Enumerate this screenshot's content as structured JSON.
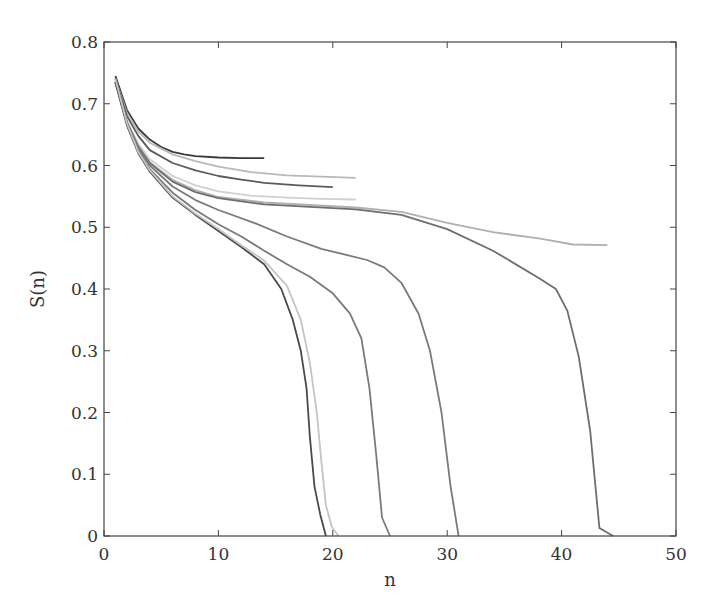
{
  "chart_data": {
    "type": "line",
    "title": "",
    "xlabel": "n",
    "ylabel": "S(n)",
    "xlim": [
      0,
      50
    ],
    "ylim": [
      0,
      0.8
    ],
    "xticks": [
      0,
      10,
      20,
      30,
      40,
      50
    ],
    "xtick_labels": [
      "0",
      "10",
      "20",
      "30",
      "40",
      "50"
    ],
    "yticks": [
      0,
      0.1,
      0.2,
      0.3,
      0.4,
      0.5,
      0.6,
      0.7,
      0.8
    ],
    "ytick_labels": [
      "0",
      "0.1",
      "0.2",
      "0.3",
      "0.4",
      "0.5",
      "0.6",
      "0.7",
      "0.8"
    ],
    "grid": false,
    "legend": null,
    "series": [
      {
        "name": "curve-1",
        "color": "#3a3a3a",
        "x": [
          1,
          2,
          3,
          4,
          5,
          6,
          7,
          8,
          10,
          12,
          14
        ],
        "y": [
          0.745,
          0.69,
          0.66,
          0.642,
          0.63,
          0.622,
          0.618,
          0.615,
          0.613,
          0.612,
          0.612
        ]
      },
      {
        "name": "curve-2",
        "color": "#b8b8b8",
        "x": [
          1,
          2,
          3,
          4,
          6,
          8,
          10,
          13,
          16,
          19,
          22
        ],
        "y": [
          0.74,
          0.685,
          0.655,
          0.637,
          0.618,
          0.607,
          0.598,
          0.589,
          0.584,
          0.582,
          0.58
        ]
      },
      {
        "name": "curve-3",
        "color": "#5a5a5a",
        "x": [
          1,
          2,
          3,
          4,
          6,
          8,
          10,
          12,
          14,
          17,
          20
        ],
        "y": [
          0.74,
          0.68,
          0.648,
          0.625,
          0.604,
          0.592,
          0.583,
          0.577,
          0.572,
          0.568,
          0.565
        ]
      },
      {
        "name": "curve-4",
        "color": "#d0d0d0",
        "x": [
          1,
          2,
          3,
          4,
          6,
          8,
          10,
          13,
          16,
          19,
          22
        ],
        "y": [
          0.735,
          0.672,
          0.635,
          0.61,
          0.583,
          0.568,
          0.558,
          0.551,
          0.548,
          0.546,
          0.545
        ]
      },
      {
        "name": "curve-5",
        "color": "#b0b0b0",
        "x": [
          1,
          2,
          3,
          4,
          6,
          8,
          10,
          14,
          18,
          22,
          26,
          30,
          34,
          38,
          41,
          44
        ],
        "y": [
          0.735,
          0.67,
          0.632,
          0.605,
          0.577,
          0.56,
          0.549,
          0.54,
          0.536,
          0.532,
          0.525,
          0.507,
          0.492,
          0.482,
          0.472,
          0.471
        ]
      },
      {
        "name": "curve-6",
        "color": "#6e6e6e",
        "x": [
          1,
          2,
          3,
          4,
          6,
          8,
          10,
          14,
          18,
          22,
          26,
          30,
          34,
          38,
          39.5,
          40.5,
          41.5,
          42.5,
          43.3,
          44.5
        ],
        "y": [
          0.735,
          0.67,
          0.63,
          0.604,
          0.574,
          0.557,
          0.547,
          0.537,
          0.533,
          0.529,
          0.52,
          0.497,
          0.462,
          0.418,
          0.4,
          0.365,
          0.29,
          0.17,
          0.013,
          0.0
        ]
      },
      {
        "name": "curve-7",
        "color": "#7a7a7a",
        "x": [
          1,
          2,
          3,
          4,
          6,
          8,
          10,
          13,
          16,
          19,
          21,
          23,
          24.5,
          26,
          27.5,
          28.5,
          29.5,
          30.3,
          31
        ],
        "y": [
          0.735,
          0.67,
          0.628,
          0.6,
          0.566,
          0.544,
          0.528,
          0.508,
          0.485,
          0.465,
          0.456,
          0.447,
          0.435,
          0.41,
          0.36,
          0.3,
          0.2,
          0.08,
          0.0
        ]
      },
      {
        "name": "curve-8",
        "color": "#7a7a7a",
        "x": [
          1,
          2,
          3,
          4,
          6,
          8,
          10,
          12,
          14,
          16,
          18,
          20,
          21.5,
          22.5,
          23.2,
          23.8,
          24.3,
          25
        ],
        "y": [
          0.735,
          0.668,
          0.624,
          0.594,
          0.556,
          0.528,
          0.505,
          0.485,
          0.462,
          0.44,
          0.42,
          0.393,
          0.36,
          0.32,
          0.24,
          0.13,
          0.03,
          0.0
        ]
      },
      {
        "name": "curve-9",
        "color": "#4a4a4a",
        "x": [
          1,
          2,
          3,
          4,
          6,
          8,
          10,
          12,
          14,
          15.5,
          16.5,
          17.2,
          17.7,
          18.0,
          18.4,
          18.9,
          19.4
        ],
        "y": [
          0.735,
          0.665,
          0.62,
          0.59,
          0.548,
          0.52,
          0.494,
          0.468,
          0.44,
          0.4,
          0.35,
          0.3,
          0.24,
          0.16,
          0.08,
          0.035,
          0.0
        ]
      },
      {
        "name": "curve-10",
        "color": "#c4c4c4",
        "x": [
          1,
          2,
          3,
          4,
          6,
          8,
          10,
          12,
          14,
          16,
          17.2,
          18.0,
          18.6,
          19.0,
          19.4,
          19.9,
          20.5
        ],
        "y": [
          0.74,
          0.668,
          0.622,
          0.592,
          0.55,
          0.522,
          0.497,
          0.471,
          0.446,
          0.405,
          0.35,
          0.28,
          0.2,
          0.12,
          0.05,
          0.015,
          0.0
        ]
      }
    ]
  }
}
